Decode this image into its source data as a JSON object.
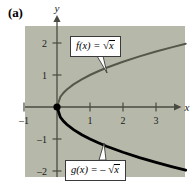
{
  "figure": {
    "panel_label": "(a)",
    "background_color": "#b6b9a9",
    "page_background": "#ffffff"
  },
  "axes": {
    "x_axis_name": "x",
    "y_axis_name": "y",
    "x_ticks": [
      {
        "value": -1,
        "label": "–1"
      },
      {
        "value": 1,
        "label": "1"
      },
      {
        "value": 2,
        "label": "2"
      },
      {
        "value": 3,
        "label": "3"
      }
    ],
    "y_ticks": [
      {
        "value": 2,
        "label": "2"
      },
      {
        "value": 1,
        "label": "1"
      },
      {
        "value": -1,
        "label": "–1"
      },
      {
        "value": -2,
        "label": "–2"
      }
    ],
    "origin_marker": "filled-dot"
  },
  "callouts": {
    "upper": {
      "func_name": "f",
      "arg": "(x)",
      "equals": "=",
      "sign": "",
      "radicand": "x",
      "full_text": "f(x) = √x"
    },
    "lower": {
      "func_name": "g",
      "arg": "(x)",
      "equals": "=",
      "sign": "–",
      "radicand": "x",
      "full_text": "g(x) = –√x"
    }
  },
  "chart_data": {
    "type": "line",
    "title": "",
    "xlabel": "x",
    "ylabel": "y",
    "xlim": [
      -1.0,
      3.9
    ],
    "ylim": [
      -2.4,
      2.55
    ],
    "grid": false,
    "legend": "callout-labels",
    "xticks": [
      -1,
      1,
      2,
      3
    ],
    "yticks": [
      -2,
      -1,
      1,
      2
    ],
    "series": [
      {
        "name": "f(x) = √x",
        "color": "#55574a",
        "width": 2.0,
        "x": [
          0,
          0.1,
          0.2,
          0.3,
          0.5,
          0.75,
          1.0,
          1.25,
          1.5,
          2.0,
          2.5,
          3.0,
          3.5,
          3.9
        ],
        "y": [
          0,
          0.316,
          0.447,
          0.548,
          0.707,
          0.866,
          1.0,
          1.118,
          1.225,
          1.414,
          1.581,
          1.732,
          1.871,
          1.975
        ]
      },
      {
        "name": "g(x) = –√x",
        "color": "#000000",
        "width": 2.8,
        "x": [
          0,
          0.1,
          0.2,
          0.3,
          0.5,
          0.75,
          1.0,
          1.25,
          1.5,
          2.0,
          2.5,
          3.0,
          3.5,
          3.9
        ],
        "y": [
          0,
          -0.316,
          -0.447,
          -0.548,
          -0.707,
          -0.866,
          -1.0,
          -1.118,
          -1.225,
          -1.414,
          -1.581,
          -1.732,
          -1.871,
          -1.975
        ]
      }
    ],
    "points": [
      {
        "x": 0,
        "y": 0,
        "marker": "filled-circle",
        "color": "#000000"
      }
    ],
    "annotations": [
      {
        "text": "f(x) = √x",
        "target_x": 1.4,
        "target_y": 1.18
      },
      {
        "text": "g(x) = –√x",
        "target_x": 1.35,
        "target_y": -1.16
      }
    ]
  }
}
